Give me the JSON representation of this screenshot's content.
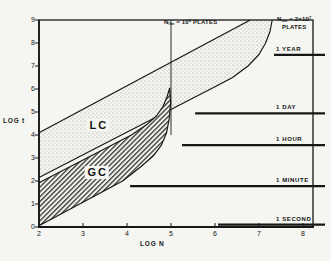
{
  "figure": {
    "background": "#f5f5f1",
    "ink": "#161616"
  },
  "chart_data": {
    "type": "area",
    "xlabel": "LOG N",
    "ylabel": "LOG t",
    "xlim": [
      2,
      8.23
    ],
    "ylim": [
      0,
      9
    ],
    "x_ticks": [
      2,
      3,
      4,
      5,
      6,
      7,
      8
    ],
    "y_ticks": [
      0,
      1,
      2,
      3,
      4,
      5,
      6,
      7,
      8,
      9
    ],
    "grid": false,
    "bands": [
      {
        "name": "LC",
        "label": "LC",
        "fill": "stipple",
        "label_pos": [
          3.34,
          4.43
        ],
        "upper": [
          [
            2,
            4.1
          ],
          [
            6.8,
            9
          ]
        ],
        "lower": [
          [
            2,
            2.15
          ],
          [
            6.0,
            6.1
          ],
          [
            6.4,
            6.5
          ],
          [
            6.75,
            7.0
          ],
          [
            7.0,
            7.5
          ],
          [
            7.15,
            8.0
          ],
          [
            7.25,
            8.5
          ],
          [
            7.3,
            9.0
          ]
        ]
      },
      {
        "name": "GC",
        "label": "GC",
        "fill": "hatch",
        "label_pos": [
          3.31,
          2.37
        ],
        "upper": [
          [
            2,
            1.92
          ],
          [
            4.1,
            4.0
          ],
          [
            4.45,
            4.45
          ],
          [
            4.68,
            4.85
          ],
          [
            4.82,
            5.25
          ],
          [
            4.91,
            5.65
          ],
          [
            4.97,
            6.05
          ]
        ],
        "lower": [
          [
            2,
            0.05
          ],
          [
            3.9,
            2.0
          ],
          [
            4.3,
            2.6
          ],
          [
            4.6,
            3.1
          ],
          [
            4.78,
            3.55
          ],
          [
            4.9,
            4.1
          ],
          [
            4.96,
            4.7
          ],
          [
            4.99,
            5.4
          ],
          [
            4.97,
            6.05
          ]
        ]
      }
    ],
    "asymptote_line": {
      "x": 5,
      "t_top": 9,
      "t_bottom": 4.0
    },
    "annotations": [
      {
        "id": "nlim1",
        "base": "N",
        "sub": "lim",
        "mid": " = 10",
        "sup": "5",
        "suffix": " PLATES",
        "line2": ""
      },
      {
        "id": "nlim2",
        "base": "N",
        "sub": "lim",
        "mid": " = 2×10",
        "sup": "7",
        "suffix": "",
        "line2": "PLATES"
      }
    ],
    "time_lines": [
      {
        "label": "1 YEAR",
        "t": 7.48,
        "n_start": 7.34,
        "n_end": 8.5
      },
      {
        "label": "1 DAY",
        "t": 4.94,
        "n_start": 5.55,
        "n_end": 8.5
      },
      {
        "label": "1 HOUR",
        "t": 3.56,
        "n_start": 5.25,
        "n_end": 8.5
      },
      {
        "label": "1 MINUTE",
        "t": 1.78,
        "n_start": 4.07,
        "n_end": 8.5
      },
      {
        "label": "1 SECOND",
        "t": 0.1,
        "n_start": 6.07,
        "n_end": 8.5
      }
    ]
  }
}
